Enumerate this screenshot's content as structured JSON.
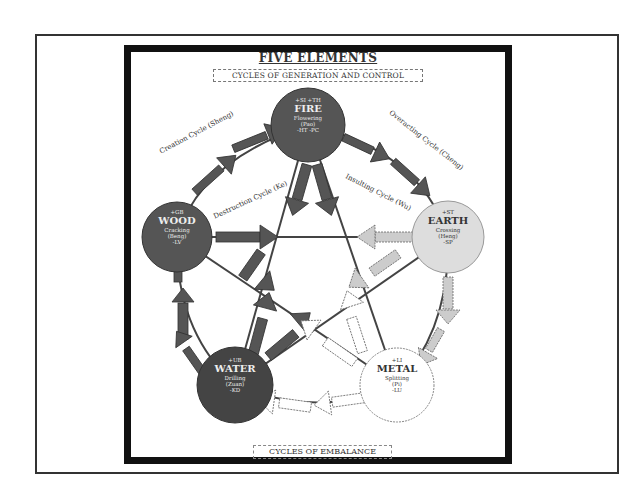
{
  "diagram": {
    "title": "FIVE ELEMENTS",
    "subtitle": "CYCLES OF GENERATION AND CONTROL",
    "bottom_label": "CYCLES OF EMBALANCE",
    "cycles": {
      "creation": "Creation Cycle (Sheng)",
      "overacting": "Overacting Cycle (Cheng)",
      "destruction": "Destruction Cycle (Ke)",
      "insulting": "Insulting Cycle (Wu)"
    },
    "arrow_labels": {
      "creates": "Creates",
      "overacts": "Overacts",
      "destroys": "Destroys",
      "insults": "Insults"
    },
    "nodes": {
      "fire": {
        "top": "+SI  +TH",
        "name": "FIRE",
        "action": "Flowering",
        "chinese": "(Pao)",
        "organs": "-HT  -PC",
        "fill": "#555555"
      },
      "wood": {
        "top": "+GB",
        "name": "WOOD",
        "action": "Cracking",
        "chinese": "(Beng)",
        "organs": "-LV",
        "fill": "#555555"
      },
      "earth": {
        "top": "+ST",
        "name": "EARTH",
        "action": "Crossing",
        "chinese": "(Heng)",
        "organs": "-SP",
        "fill": "#dddddd"
      },
      "water": {
        "top": "+UB",
        "name": "WATER",
        "action": "Drilling",
        "chinese": "(Zuan)",
        "organs": "-KD",
        "fill": "#444444"
      },
      "metal": {
        "top": "+LI",
        "name": "METAL",
        "action": "Splitting",
        "chinese": "(Pi)",
        "organs": "-LU",
        "fill": "#ffffff"
      }
    }
  }
}
